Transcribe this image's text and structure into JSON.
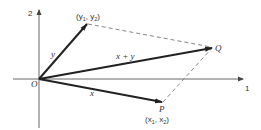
{
  "diagram": {
    "type": "vector-addition",
    "colors": {
      "axis": "#555555",
      "vector": "#222222",
      "dashed": "#777777",
      "text": "#333333",
      "background": "#ffffff"
    },
    "axes": {
      "horizontal_label": "1",
      "vertical_label": "2"
    },
    "origin": {
      "label": "O"
    },
    "points": {
      "Q": {
        "label": "Q"
      },
      "P": {
        "label": "P",
        "coords_prefix": "(x",
        "coords_sub1": "1",
        "coords_mid": ", x",
        "coords_sub2": "2",
        "coords_suffix": ")"
      },
      "Y": {
        "coords_prefix": "(y",
        "coords_sub1": "1",
        "coords_mid": ", y",
        "coords_sub2": "2",
        "coords_suffix": ")"
      }
    },
    "vectors": {
      "x": {
        "label": "x"
      },
      "y": {
        "label": "y"
      },
      "sum": {
        "label": "x + y"
      }
    }
  }
}
